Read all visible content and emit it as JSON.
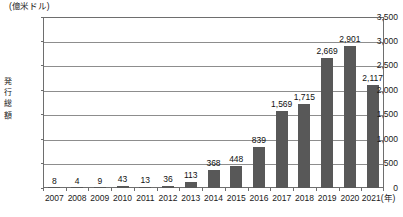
{
  "chart_data": {
    "type": "bar",
    "title": "",
    "subtitle": "",
    "unit_caption": "(億米ドル)",
    "ylabel": "発行総額",
    "xlabel": "(年)",
    "xlabel_suffix": "(年)",
    "categories": [
      "2007",
      "2008",
      "2009",
      "2010",
      "2011",
      "2012",
      "2013",
      "2014",
      "2015",
      "2016",
      "2017",
      "2018",
      "2019",
      "2020",
      "2021"
    ],
    "values": [
      8,
      4,
      9,
      43,
      13,
      36,
      113,
      368,
      448,
      839,
      1569,
      1715,
      2669,
      2901,
      2117
    ],
    "value_labels": [
      "8",
      "4",
      "9",
      "43",
      "13",
      "36",
      "113",
      "368",
      "448",
      "839",
      "1,569",
      "1,715",
      "2,669",
      "2,901",
      "2,117"
    ],
    "ylim": [
      0,
      3500
    ],
    "yticks": [
      0,
      500,
      1000,
      1500,
      2000,
      2500,
      3000,
      3500
    ],
    "ytick_labels": [
      "0",
      "500",
      "1,000",
      "1,500",
      "2,000",
      "2,500",
      "3,000",
      "3,500"
    ],
    "grid": true,
    "legend": false,
    "bar_color": "#585858",
    "grid_color": "#8d8d8d",
    "frame_color": "#6e6e6e",
    "last_category_label": "2021(年)"
  }
}
